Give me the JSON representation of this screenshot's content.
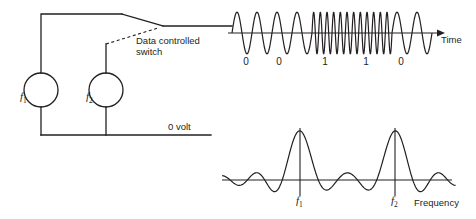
{
  "figure": {
    "stroke_color": "#231f20",
    "background_color": "#ffffff"
  },
  "circuit": {
    "switch_label": "Data controlled\nswitch",
    "ground_label": "0 volt",
    "oscillators": [
      {
        "name": "f",
        "subscript": "1"
      },
      {
        "name": "f",
        "subscript": "2"
      }
    ]
  },
  "waveform": {
    "axis_label": "Time",
    "bits": [
      "0",
      "0",
      "1",
      "1",
      "0"
    ]
  },
  "spectrum": {
    "axis_label": "Frequency",
    "peaks": [
      {
        "name": "f",
        "subscript": "1"
      },
      {
        "name": "f",
        "subscript": "2"
      }
    ]
  },
  "chart_data": [
    {
      "type": "line",
      "title": "FSK modulated signal in time domain",
      "xlabel": "Time",
      "ylabel": "",
      "grid": false,
      "legend": "none",
      "annotations": [
        "0",
        "0",
        "1",
        "1",
        "0"
      ],
      "bit_sequence": [
        0,
        0,
        1,
        1,
        0
      ],
      "bit_boundaries_px": [
        232,
        272,
        312,
        352,
        392,
        432
      ],
      "low_frequency_cycles_per_bit": 2,
      "high_frequency_cycles_per_bit": 6,
      "amplitude": 1,
      "baseline_y_px": 33
    },
    {
      "type": "line",
      "title": "FSK power spectrum",
      "xlabel": "Frequency",
      "ylabel": "",
      "grid": false,
      "legend": "none",
      "annotations": [
        "f1",
        "f2"
      ],
      "peak_centers_px": [
        300,
        395
      ],
      "peak_heights": [
        1,
        1
      ],
      "lobe_pattern": "sinc",
      "baseline_y_px": 180
    }
  ]
}
